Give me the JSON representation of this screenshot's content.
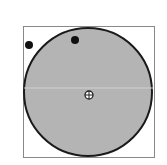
{
  "diagram": {
    "frame": {
      "x": 23,
      "y": 26,
      "w": 131,
      "h": 131,
      "stroke": "#888888"
    },
    "circle": {
      "cx": 88,
      "cy": 92,
      "r": 65,
      "fill": "#b4b4b4",
      "stroke": "#1a1a1a"
    },
    "center_marker": {
      "cx": 89,
      "cy": 95,
      "r": 4,
      "icon": "crosshair-icon"
    },
    "dots": [
      {
        "cx": 29,
        "cy": 45,
        "r": 4,
        "fill": "#111111"
      },
      {
        "cx": 75,
        "cy": 40,
        "r": 4,
        "fill": "#111111"
      }
    ],
    "midline": {
      "y": 88,
      "stroke": "#d0d0d0"
    }
  }
}
